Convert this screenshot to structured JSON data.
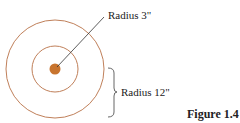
{
  "figure": {
    "caption": "Figure 1.4",
    "labels": {
      "inner_radius": "Radius 3\"",
      "outer_radius": "Radius 12\""
    },
    "colors": {
      "ring": "#c0805a",
      "dot": "#c8742e",
      "line": "#333333"
    }
  }
}
